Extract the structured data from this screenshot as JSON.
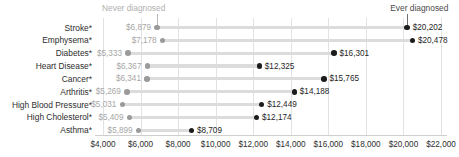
{
  "annotations": {
    "never_label": "Never diagnosed",
    "ever_label": "Ever diagnosed"
  },
  "axis": {
    "ticks": [
      "$4,000",
      "$6,000",
      "$8,000",
      "$10,000",
      "$12,000",
      "$14,000",
      "$16,000",
      "$18,000",
      "$20,000",
      "$22,000"
    ]
  },
  "colors": {
    "never_dot": "#9a9a9a",
    "ever_dot": "#1c1c1c",
    "connector": "#dcdcdc",
    "gridline": "#e2e2e2"
  },
  "rows": [
    {
      "label": "Stroke*",
      "never_value": 6879,
      "ever_value": 20202,
      "never_text": "$6,879",
      "ever_text": "$20,202"
    },
    {
      "label": "Emphysema*",
      "never_value": 7178,
      "ever_value": 20478,
      "never_text": "$7,178",
      "ever_text": "$20,478"
    },
    {
      "label": "Diabetes*",
      "never_value": 5333,
      "ever_value": 16301,
      "never_text": "$5,333",
      "ever_text": "$16,301"
    },
    {
      "label": "Heart Disease*",
      "never_value": 6367,
      "ever_value": 12325,
      "never_text": "$6,367",
      "ever_text": "$12,325"
    },
    {
      "label": "Cancer*",
      "never_value": 6341,
      "ever_value": 15765,
      "never_text": "$6,341",
      "ever_text": "$15,765"
    },
    {
      "label": "Arthritis*",
      "never_value": 5269,
      "ever_value": 14188,
      "never_text": "$5,269",
      "ever_text": "$14,188"
    },
    {
      "label": "High Blood Pressure*",
      "never_value": 5031,
      "ever_value": 12449,
      "never_text": "$5,031",
      "ever_text": "$12,449"
    },
    {
      "label": "High Cholesterol*",
      "never_value": 5409,
      "ever_value": 12174,
      "never_text": "$5,409",
      "ever_text": "$12,174"
    },
    {
      "label": "Asthma*",
      "never_value": 5899,
      "ever_value": 8709,
      "never_text": "$5,899",
      "ever_text": "$8,709"
    }
  ],
  "chart_data": {
    "type": "scatter",
    "subtype": "dumbbell",
    "title": "",
    "xlabel": "",
    "ylabel": "",
    "xlim": [
      4000,
      22000
    ],
    "grid": true,
    "legend_position": "top-inline-annotation",
    "categories": [
      "Stroke*",
      "Emphysema*",
      "Diabetes*",
      "Heart Disease*",
      "Cancer*",
      "Arthritis*",
      "High Blood Pressure*",
      "High Cholesterol*",
      "Asthma*"
    ],
    "series": [
      {
        "name": "Never diagnosed",
        "color": "#9a9a9a",
        "values": [
          6879,
          7178,
          5333,
          6367,
          6341,
          5269,
          5031,
          5409,
          5899
        ]
      },
      {
        "name": "Ever diagnosed",
        "color": "#1c1c1c",
        "values": [
          20202,
          20478,
          16301,
          12325,
          15765,
          14188,
          12449,
          12174,
          8709
        ]
      }
    ],
    "xticks": [
      4000,
      6000,
      8000,
      10000,
      12000,
      14000,
      16000,
      18000,
      20000,
      22000
    ],
    "xticklabels": [
      "$4,000",
      "$6,000",
      "$8,000",
      "$10,000",
      "$12,000",
      "$14,000",
      "$16,000",
      "$18,000",
      "$20,000",
      "$22,000"
    ],
    "annotations": [
      "Never diagnosed",
      "Ever diagnosed"
    ]
  }
}
